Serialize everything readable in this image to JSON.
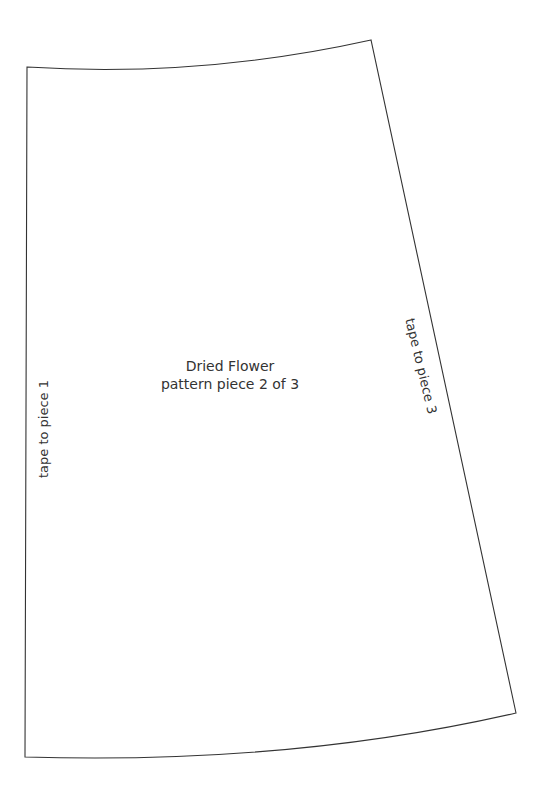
{
  "pattern": {
    "title": "Dried Flower",
    "subtitle": "pattern piece 2 of 3",
    "left_edge_label": "tape to piece 1",
    "right_edge_label": "tape to piece 3",
    "outline_color": "#333333",
    "background_color": "#ffffff"
  }
}
